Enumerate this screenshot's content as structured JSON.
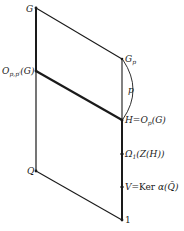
{
  "diagram": {
    "type": "subgroup-lattice",
    "nodes": [
      {
        "id": "G",
        "label": "G",
        "x": 36,
        "y": 8
      },
      {
        "id": "Opp",
        "label": "O_{p,p'}(G)",
        "display": "Op,p′(G)",
        "x": 36,
        "y": 71
      },
      {
        "id": "Q",
        "label": "Q",
        "x": 36,
        "y": 171
      },
      {
        "id": "Gp",
        "label": "G_p",
        "display": "Gp",
        "x": 122,
        "y": 59
      },
      {
        "id": "H",
        "label": "H = O_p(G)",
        "display": "H=Op(G)",
        "x": 122,
        "y": 120
      },
      {
        "id": "Omega",
        "label": "Ω_1(Z(H))",
        "display": "Ω1(Z(H))",
        "x": 122,
        "y": 154
      },
      {
        "id": "V",
        "label": "V = Ker α(Q̄)",
        "display": "V=Ker α(Q̄)",
        "x": 122,
        "y": 187
      },
      {
        "id": "one",
        "label": "1",
        "x": 122,
        "y": 220
      }
    ],
    "edges": [
      {
        "from": "G",
        "to": "Opp",
        "weight": "thick"
      },
      {
        "from": "Opp",
        "to": "Q",
        "weight": "normal"
      },
      {
        "from": "G",
        "to": "Gp",
        "weight": "normal"
      },
      {
        "from": "Opp",
        "to": "H",
        "weight": "thick"
      },
      {
        "from": "Q",
        "to": "one",
        "weight": "normal"
      },
      {
        "from": "Gp",
        "to": "H",
        "weight": "normal"
      },
      {
        "from": "H",
        "to": "one",
        "weight": "thick"
      }
    ],
    "arc": {
      "from": "Gp",
      "to": "H",
      "label": "p"
    }
  },
  "labels": {
    "G": "G",
    "opp_main": "O",
    "opp_sub": "p,p′",
    "opp_tail": "(G)",
    "Q": "Q",
    "Gp_main": "G",
    "Gp_sub": "p",
    "arc_p": "p",
    "H_main": "H=O",
    "H_sub": "p",
    "H_tail": "(G)",
    "omega_main": "Ω",
    "omega_sub": "1",
    "omega_tail": "(Z(H))",
    "V_main": "V=",
    "V_ker": "Ker",
    "V_tail": " α(Q̄)",
    "one": "1"
  }
}
